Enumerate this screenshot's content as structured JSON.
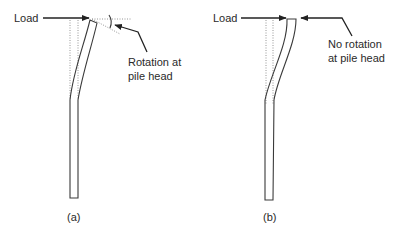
{
  "figure": {
    "panels": [
      {
        "id": "a",
        "caption": "(a)",
        "load_label": "Load",
        "annotation_line1": "Rotation at",
        "annotation_line2": "pile head",
        "condition": "free head - rotation at pile head"
      },
      {
        "id": "b",
        "caption": "(b)",
        "load_label": "Load",
        "annotation_line1": "No rotation",
        "annotation_line2": "at pile head",
        "condition": "fixed head - no rotation at pile head"
      }
    ]
  },
  "colors": {
    "line": "#3a3a3a",
    "dotted": "#8a8a8a",
    "text": "#2a2a2a",
    "background": "#ffffff"
  }
}
